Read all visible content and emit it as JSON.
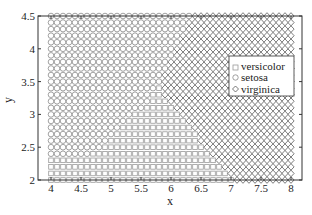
{
  "chart_data": {
    "type": "scatter",
    "title": "",
    "xlabel": "x",
    "ylabel": "y",
    "xlim": [
      4,
      8
    ],
    "ylim": [
      2,
      4.5
    ],
    "xticks": [
      4,
      4.5,
      5,
      5.5,
      6,
      6.5,
      7,
      7.5,
      8
    ],
    "xtick_labels": [
      "4",
      "4.5",
      "5",
      "5.5",
      "6",
      "6.5",
      "7",
      "7.5",
      "8"
    ],
    "yticks": [
      2,
      2.5,
      3,
      3.5,
      4,
      4.5
    ],
    "ytick_labels": [
      "2",
      "2.5",
      "3",
      "3.5",
      "4",
      "4.5"
    ],
    "grid": false,
    "legend_position": "right-center (inside)",
    "grid_step": 0.1,
    "series": [
      {
        "name": "versicolor",
        "marker": "square",
        "color": "#9a9a9a",
        "region": "lower-left/middle, below setosa boundary and left of virginica boundary"
      },
      {
        "name": "setosa",
        "marker": "circle",
        "color": "#8a8a8a",
        "region": "upper-left"
      },
      {
        "name": "virginica",
        "marker": "diamond",
        "color": "#5a5a5a",
        "region": "right side"
      }
    ],
    "boundaries": {
      "setosa_versicolor": [
        [
          4.0,
          2.35
        ],
        [
          4.6,
          2.35
        ],
        [
          4.9,
          2.55
        ],
        [
          5.4,
          3.0
        ],
        [
          5.8,
          3.4
        ]
      ],
      "setosa_virginica": [
        [
          5.8,
          3.4
        ],
        [
          6.3,
          4.5
        ]
      ],
      "versicolor_virginica": [
        [
          5.8,
          3.4
        ],
        [
          7.0,
          2.0
        ]
      ]
    }
  },
  "legend": {
    "items": [
      {
        "label": "versicolor",
        "marker": "square"
      },
      {
        "label": "setosa",
        "marker": "circle"
      },
      {
        "label": "virginica",
        "marker": "diamond"
      }
    ]
  },
  "axes": {
    "xlabel": "x",
    "ylabel": "y"
  }
}
